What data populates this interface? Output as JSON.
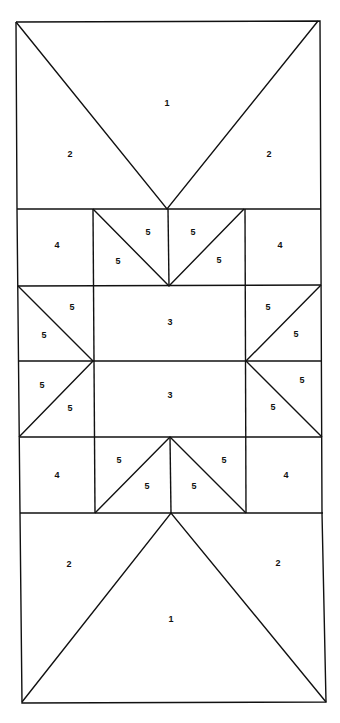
{
  "diagram": {
    "type": "quilt-block-piecing-diagram",
    "labels": [
      {
        "id": "top-1",
        "text": "1",
        "x": 167,
        "y": 104
      },
      {
        "id": "top-2-left",
        "text": "2",
        "x": 70,
        "y": 155
      },
      {
        "id": "top-2-right",
        "text": "2",
        "x": 269,
        "y": 155
      },
      {
        "id": "r1-4-left",
        "text": "4",
        "x": 57,
        "y": 246
      },
      {
        "id": "r1-5-a",
        "text": "5",
        "x": 148,
        "y": 233
      },
      {
        "id": "r1-5-b",
        "text": "5",
        "x": 118,
        "y": 262
      },
      {
        "id": "r1-5-c",
        "text": "5",
        "x": 193,
        "y": 233
      },
      {
        "id": "r1-5-d",
        "text": "5",
        "x": 219,
        "y": 261
      },
      {
        "id": "r1-4-right",
        "text": "4",
        "x": 280,
        "y": 246
      },
      {
        "id": "r2-5-a",
        "text": "5",
        "x": 72,
        "y": 308
      },
      {
        "id": "r2-5-b",
        "text": "5",
        "x": 44,
        "y": 336
      },
      {
        "id": "r2-3",
        "text": "3",
        "x": 170,
        "y": 323
      },
      {
        "id": "r2-5-c",
        "text": "5",
        "x": 268,
        "y": 308
      },
      {
        "id": "r2-5-d",
        "text": "5",
        "x": 296,
        "y": 335
      },
      {
        "id": "r3-5-a",
        "text": "5",
        "x": 42,
        "y": 386
      },
      {
        "id": "r3-5-b",
        "text": "5",
        "x": 70,
        "y": 409
      },
      {
        "id": "r3-3",
        "text": "3",
        "x": 170,
        "y": 396
      },
      {
        "id": "r3-5-c",
        "text": "5",
        "x": 302,
        "y": 381
      },
      {
        "id": "r3-5-d",
        "text": "5",
        "x": 273,
        "y": 408
      },
      {
        "id": "r4-4-left",
        "text": "4",
        "x": 57,
        "y": 476
      },
      {
        "id": "r4-5-a",
        "text": "5",
        "x": 119,
        "y": 461
      },
      {
        "id": "r4-5-b",
        "text": "5",
        "x": 147,
        "y": 487
      },
      {
        "id": "r4-5-c",
        "text": "5",
        "x": 224,
        "y": 461
      },
      {
        "id": "r4-5-d",
        "text": "5",
        "x": 194,
        "y": 487
      },
      {
        "id": "r4-4-right",
        "text": "4",
        "x": 286,
        "y": 476
      },
      {
        "id": "bot-2-left",
        "text": "2",
        "x": 69,
        "y": 565
      },
      {
        "id": "bot-2-right",
        "text": "2",
        "x": 278,
        "y": 564
      },
      {
        "id": "bot-1",
        "text": "1",
        "x": 171,
        "y": 620
      }
    ]
  }
}
